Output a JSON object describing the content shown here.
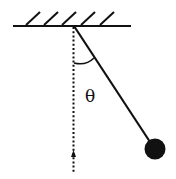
{
  "diagram": {
    "type": "simple-pendulum",
    "angle_label": "θ",
    "colors": {
      "line": "#111111",
      "bob": "#111111",
      "background": "#ffffff"
    }
  }
}
